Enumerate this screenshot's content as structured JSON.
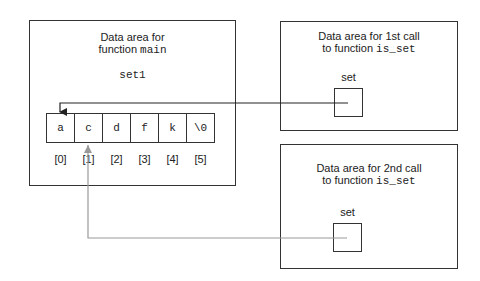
{
  "main_area": {
    "title_line1": "Data area for",
    "title_line2_prefix": "function ",
    "title_line2_code": "main",
    "variable": "set1",
    "cells": [
      "a",
      "c",
      "d",
      "f",
      "k",
      "\\0"
    ],
    "indices": [
      "[0]",
      "[1]",
      "[2]",
      "[3]",
      "[4]",
      "[5]"
    ]
  },
  "call1_area": {
    "title_line1": "Data area for 1st call",
    "title_line2_prefix": "to function ",
    "title_line2_code": "is_set",
    "variable": "set",
    "points_to_index": 0,
    "arrow_color": "#222222"
  },
  "call2_area": {
    "title_line1": "Data area for 2nd call",
    "title_line2_prefix": "to function ",
    "title_line2_code": "is_set",
    "variable": "set",
    "points_to_index": 1,
    "arrow_color": "#999999"
  }
}
